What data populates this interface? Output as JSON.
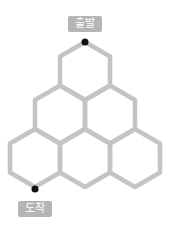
{
  "labels": {
    "start": "출발",
    "end": "도착"
  },
  "colors": {
    "edge": "#c4c4c4",
    "dot": "#111111",
    "label_bg": "#b5b5b5",
    "label_text": "#ffffff"
  },
  "grid": {
    "rows": [
      1,
      2,
      3
    ],
    "hex_half_width": 25,
    "hex_radius": 29
  }
}
